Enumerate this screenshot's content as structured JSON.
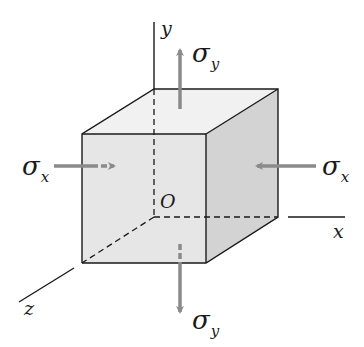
{
  "diagram": {
    "axes": {
      "x": "x",
      "y": "y",
      "z": "z",
      "origin": "O"
    },
    "stresses": {
      "sigma_x_left": {
        "symbol": "σ",
        "subscript": "x"
      },
      "sigma_x_right": {
        "symbol": "σ",
        "subscript": "x"
      },
      "sigma_y_top": {
        "symbol": "σ",
        "subscript": "y"
      },
      "sigma_y_bottom": {
        "symbol": "σ",
        "subscript": "y"
      }
    },
    "colors": {
      "line": "#1a1a1a",
      "arrow": "#8a8a8a",
      "front_face": "#e6e6e6",
      "top_face": "#f1f1f1",
      "side_face": "#d3d3d3"
    }
  }
}
